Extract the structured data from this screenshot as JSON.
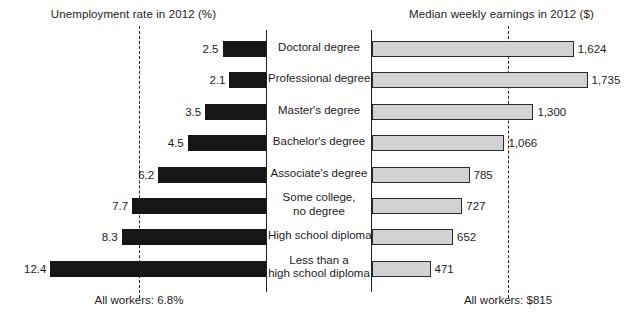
{
  "chart_data": {
    "type": "bar",
    "orientation": "horizontal",
    "layout": "two-panel diverging (left panel bars extend leftward, right panel bars extend rightward)",
    "grid": false,
    "legend": "none",
    "categories": [
      "Doctoral degree",
      "Professional degree",
      "Master's degree",
      "Bachelor's degree",
      "Associate's degree",
      "Some college, no degree",
      "High school diploma",
      "Less than a high school diploma"
    ],
    "panels": [
      {
        "id": "unemployment",
        "title": "Unemployment rate in 2012 (%)",
        "unit": "%",
        "values": [
          2.5,
          2.1,
          3.5,
          4.5,
          6.2,
          7.7,
          8.3,
          12.4
        ],
        "value_labels": [
          "2.5",
          "2.1",
          "3.5",
          "4.5",
          "6.2",
          "7.7",
          "8.3",
          "12.4"
        ],
        "reference_line": {
          "label": "All workers: 6.8%",
          "value": 6.8
        },
        "axis_max": 13.0,
        "bar_color": "#161616"
      },
      {
        "id": "earnings",
        "title": "Median weekly earnings in 2012 ($)",
        "unit": "$",
        "values": [
          1624,
          1735,
          1300,
          1066,
          785,
          727,
          652,
          471
        ],
        "value_labels": [
          "1,624",
          "1,735",
          "1,300",
          "1,066",
          "785",
          "727",
          "652",
          "471"
        ],
        "reference_line": {
          "label": "All workers: $815",
          "value": 815
        },
        "axis_max": 1900,
        "bar_color": "#d2d2d2",
        "bar_border_color": "#2b2b2b"
      }
    ]
  },
  "titles": {
    "left": "Unemployment rate in 2012 (%)",
    "right": "Median weekly earnings in 2012 ($)"
  },
  "footers": {
    "left": "All workers: 6.8%",
    "right": "All workers: $815"
  },
  "rows": [
    {
      "category_lines": [
        "Doctoral degree"
      ],
      "unemployment_label": "2.5",
      "earnings_label": "1,624"
    },
    {
      "category_lines": [
        "Professional degree"
      ],
      "unemployment_label": "2.1",
      "earnings_label": "1,735"
    },
    {
      "category_lines": [
        "Master's degree"
      ],
      "unemployment_label": "3.5",
      "earnings_label": "1,300"
    },
    {
      "category_lines": [
        "Bachelor's degree"
      ],
      "unemployment_label": "4.5",
      "earnings_label": "1,066"
    },
    {
      "category_lines": [
        "Associate's degree"
      ],
      "unemployment_label": "6.2",
      "earnings_label": "785"
    },
    {
      "category_lines": [
        "Some college,",
        "no degree"
      ],
      "unemployment_label": "7.7",
      "earnings_label": "727"
    },
    {
      "category_lines": [
        "High school diploma"
      ],
      "unemployment_label": "8.3",
      "earnings_label": "652"
    },
    {
      "category_lines": [
        "Less than a",
        "high school diploma"
      ],
      "unemployment_label": "471-row",
      "earnings_label": "471"
    }
  ]
}
